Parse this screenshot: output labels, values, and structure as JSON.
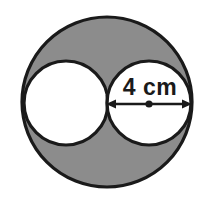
{
  "figure": {
    "type": "geometry-diagram",
    "background_color": "#ffffff",
    "shaded_color": "#8c8c8c",
    "unshaded_color": "#ffffff",
    "stroke_color": "#1a1a1a",
    "label": {
      "text": "4 cm",
      "value": 4,
      "unit": "cm",
      "measures": "diameter-of-inner-circle",
      "x": 150,
      "y": 87
    },
    "outer_circle": {
      "name": "outer-circle",
      "cx": 107,
      "cy": 102,
      "r": 85,
      "filled": true
    },
    "inner_circles": [
      {
        "name": "left-inner-circle",
        "cx": 66,
        "cy": 103,
        "r": 42,
        "filled": false
      },
      {
        "name": "right-inner-circle",
        "cx": 149,
        "cy": 103,
        "r": 42,
        "filled": false
      }
    ],
    "dimension_arrow": {
      "name": "diameter-arrow",
      "x1": 107,
      "x2": 191,
      "y": 104,
      "double_headed": true,
      "center_dot": {
        "cx": 149,
        "cy": 104,
        "r": 3.5
      }
    }
  }
}
